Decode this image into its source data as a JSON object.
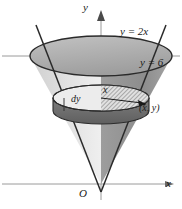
{
  "figure": {
    "background_color": "#ffffff",
    "ink_color": "#1a1a1a",
    "axis_color": "#808080",
    "labels": {
      "axis_y": "y",
      "axis_x": "x",
      "origin": "O",
      "line_slanted": "y = 2x",
      "line_horizontal": "y = 6",
      "disk_thickness": "dy",
      "disk_radius": "x",
      "point": "(x, y)"
    },
    "icons": {
      "y_axis_arrow": "arrow-up-icon",
      "x_axis_arrow": "arrow-right-icon",
      "radius_arrow": "arrow-right-icon"
    },
    "shading": {
      "cone_left_fill": "#d9d9d9",
      "cone_right_fill": "#8f8f8f",
      "top_ellipse_fill": "#b5b5b5",
      "disk_side_fill": "#6e6e6e",
      "disk_top_fill": "#e8e8e8",
      "hatch_color": "#707070"
    },
    "geometry": {
      "apex": [
        101,
        184
      ],
      "top_ellipse_center": [
        101,
        56
      ],
      "top_ellipse_rx": 71,
      "top_ellipse_ry": 20,
      "disk_ellipse_center": [
        101,
        98
      ],
      "disk_ellipse_rx": 48,
      "disk_ellipse_ry": 13,
      "disk_thickness_px": 13,
      "y_axis_x": 101,
      "x_axis_y": 184
    }
  }
}
